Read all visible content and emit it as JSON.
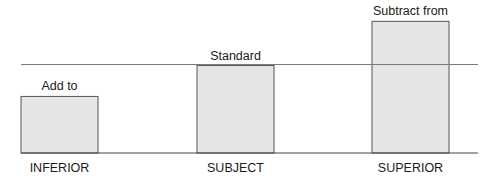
{
  "chart_data": {
    "type": "bar",
    "title": "",
    "xlabel": "",
    "ylabel": "",
    "categories": [
      "INFERIOR",
      "SUBJECT",
      "SUPERIOR"
    ],
    "values": [
      55,
      85,
      128
    ],
    "bar_annotations": [
      "Add to",
      "Standard",
      "Subtract from"
    ],
    "reference_line": {
      "label": "Standard",
      "value": 86
    },
    "ylim": [
      0,
      140
    ],
    "grid": false,
    "legend": "none",
    "colors": {
      "bar_fill": "#e6e6e6",
      "bar_stroke": "#555555",
      "line": "#777777",
      "baseline": "#444444"
    }
  }
}
